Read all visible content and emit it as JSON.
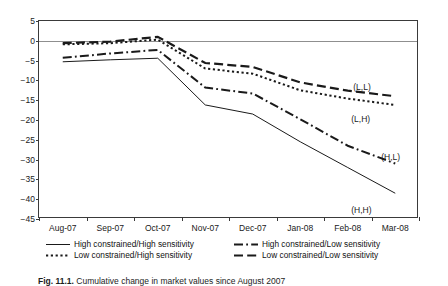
{
  "figure": {
    "caption_label": "Fig. 11.1.",
    "caption_text": "Cumulative change in market values since August 2007"
  },
  "chart_data": {
    "type": "line",
    "title": "",
    "xlabel": "",
    "ylabel": "",
    "ylim": [
      -45,
      5
    ],
    "ytick_values": [
      5,
      0,
      -5,
      -10,
      -15,
      -20,
      -25,
      -30,
      -35,
      -40,
      -45
    ],
    "ytick_labels": [
      "5",
      "0",
      "−5",
      "−10",
      "−15",
      "−20",
      "−25",
      "−30",
      "−35",
      "−40",
      "−45"
    ],
    "grid": false,
    "zero_line": true,
    "legend_position": "bottom",
    "categories": [
      "Aug-07",
      "Sep-07",
      "Oct-07",
      "Nov-07",
      "Dec-07",
      "Jan-08",
      "Feb-08",
      "Mar-08"
    ],
    "series": [
      {
        "name": "High constrained/High sensitivity",
        "short": "(H,H)",
        "style": "solid",
        "color": "#1a1a1a",
        "values": [
          -5.3,
          -4.8,
          -4.4,
          -16.2,
          -18.5,
          -25.5,
          -32.0,
          -38.5
        ]
      },
      {
        "name": "Low constrained/High sensitivity",
        "short": "(L,H)",
        "style": "dotted",
        "color": "#1a1a1a",
        "values": [
          -0.9,
          -0.6,
          0.3,
          -7.0,
          -8.3,
          -12.5,
          -14.6,
          -16.2
        ]
      },
      {
        "name": "High constrained/Low sensitivity",
        "short": "(H,L)",
        "style": "dashdot",
        "color": "#1a1a1a",
        "values": [
          -4.3,
          -3.2,
          -2.3,
          -11.8,
          -13.3,
          -19.8,
          -26.5,
          -31.0
        ]
      },
      {
        "name": "Low constrained/Low sensitivity",
        "short": "(L,L)",
        "style": "dashed",
        "color": "#1a1a1a",
        "values": [
          -0.6,
          -0.2,
          1.0,
          -5.6,
          -6.6,
          -10.5,
          -12.6,
          -14.0
        ]
      }
    ],
    "point_labels": [
      {
        "text": "(L,L)",
        "series": "Low constrained/Low sensitivity"
      },
      {
        "text": "(L,H)",
        "series": "Low constrained/High sensitivity"
      },
      {
        "text": "(H,L)",
        "series": "High constrained/Low sensitivity"
      },
      {
        "text": "(H,H)",
        "series": "High constrained/High sensitivity"
      }
    ]
  },
  "legend": {
    "entries": [
      {
        "label": "High constrained/High sensitivity",
        "style": "solid"
      },
      {
        "label": "High constrained/Low sensitivity",
        "style": "dashdot"
      },
      {
        "label": "Low constrained/High sensitivity",
        "style": "dotted"
      },
      {
        "label": "Low constrained/Low sensitivity",
        "style": "dashed"
      }
    ]
  }
}
